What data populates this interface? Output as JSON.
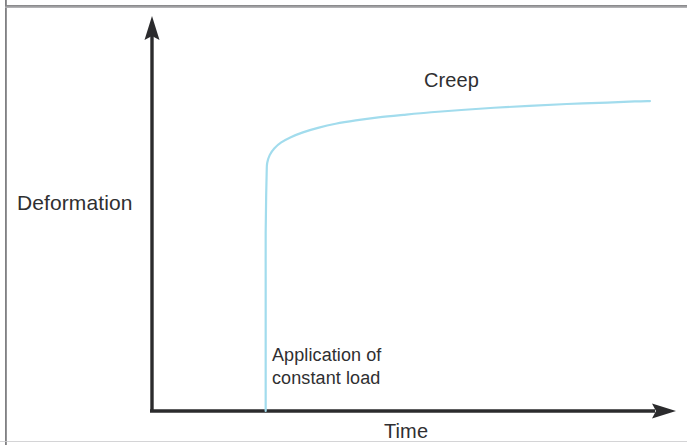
{
  "figure": {
    "background_color": "#ffffff",
    "frame_color": "#7a7a7c",
    "axis_color": "#2b2b2d",
    "text_color": "#2f2f31",
    "curve_color": "#a2dced"
  },
  "labels": {
    "y_axis_title": "Deformation",
    "x_axis_title": "Time",
    "creep": "Creep",
    "load_line_1": "Application of",
    "load_line_2": "constant load"
  },
  "chart_data": {
    "type": "line",
    "title": "",
    "subtitle": "",
    "xlabel": "Time",
    "ylabel": "Deformation",
    "xlim": [
      0,
      100
    ],
    "ylim": [
      0,
      100
    ],
    "grid": false,
    "legend": false,
    "legend_position": "none",
    "axis_style": "arrow-headed open axes, no tick marks, no tick labels",
    "annotations": [
      {
        "name": "creep-label",
        "text": "Creep",
        "x": 58,
        "y": 86,
        "description": "labels the slowly rising creep portion of the curve"
      },
      {
        "name": "load-application-label",
        "text": "Application of constant load",
        "x": 23,
        "y": 16,
        "description": "labels the instantaneous vertical jump where the constant load is applied"
      }
    ],
    "series": [
      {
        "name": "Creep deformation",
        "color": "#a2dced",
        "values": [
          {
            "x": 22.6,
            "y": 0
          },
          {
            "x": 22.6,
            "y": 12
          },
          {
            "x": 22.6,
            "y": 24
          },
          {
            "x": 22.6,
            "y": 36
          },
          {
            "x": 22.6,
            "y": 48
          },
          {
            "x": 22.7,
            "y": 58
          },
          {
            "x": 22.8,
            "y": 64
          },
          {
            "x": 22.9,
            "y": 66.5
          },
          {
            "x": 23.4,
            "y": 68.6
          },
          {
            "x": 24.3,
            "y": 70.4
          },
          {
            "x": 25.7,
            "y": 72.0
          },
          {
            "x": 27.6,
            "y": 73.4
          },
          {
            "x": 30.0,
            "y": 74.7
          },
          {
            "x": 33.0,
            "y": 75.9
          },
          {
            "x": 36.5,
            "y": 77.0
          },
          {
            "x": 40.5,
            "y": 77.9
          },
          {
            "x": 45.0,
            "y": 78.7
          },
          {
            "x": 50.0,
            "y": 79.4
          },
          {
            "x": 55.5,
            "y": 80.1
          },
          {
            "x": 61.5,
            "y": 80.7
          },
          {
            "x": 68.0,
            "y": 81.3
          },
          {
            "x": 75.0,
            "y": 81.8
          },
          {
            "x": 82.5,
            "y": 82.3
          },
          {
            "x": 90.5,
            "y": 82.7
          },
          {
            "x": 96.0,
            "y": 83.0
          },
          {
            "x": 99.0,
            "y": 83.1
          }
        ]
      }
    ]
  }
}
